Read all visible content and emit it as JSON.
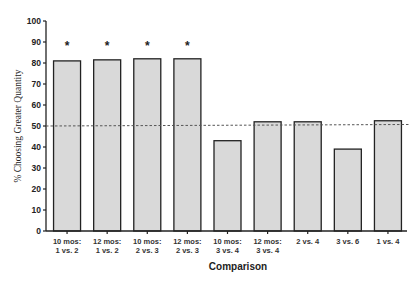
{
  "chart_data": {
    "type": "bar",
    "title": "",
    "xlabel": "Comparison",
    "ylabel": "% Choosing Greater Quantity",
    "ylim": [
      0,
      100
    ],
    "yticks": [
      0,
      10,
      20,
      30,
      40,
      50,
      60,
      70,
      80,
      90,
      100
    ],
    "grid": false,
    "legend": null,
    "categories": [
      [
        "10 mos:",
        "1 vs. 2"
      ],
      [
        "12 mos:",
        "1 vs. 2"
      ],
      [
        "10 mos:",
        "2 vs. 3"
      ],
      [
        "12 mos:",
        "2 vs. 3"
      ],
      [
        "10 mos:",
        "3 vs. 4"
      ],
      [
        "12 mos:",
        "3 vs. 4"
      ],
      [
        "2 vs. 4"
      ],
      [
        "3 vs. 6"
      ],
      [
        "1 vs. 4"
      ]
    ],
    "values": [
      81,
      81.5,
      82,
      82,
      43,
      52,
      52,
      39,
      52.5
    ],
    "significant": [
      true,
      true,
      true,
      true,
      false,
      false,
      false,
      false,
      false
    ],
    "annotations": {
      "significance_marker": "*",
      "reference_line": {
        "y": 50,
        "style": "dashed"
      }
    },
    "colors": {
      "bar_fill": "#d9d9d9",
      "bar_edge": "#222222",
      "axis": "#222222",
      "reference_line": "#555555"
    }
  }
}
